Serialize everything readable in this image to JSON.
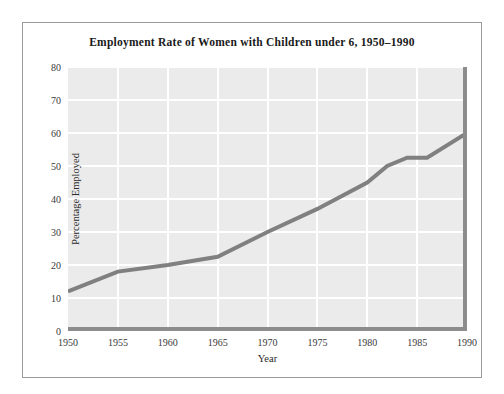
{
  "figure": {
    "background_color": "#ffffff",
    "frame_border_color": "#9a9a9a"
  },
  "chart_data": {
    "type": "line",
    "title": "Employment Rate of Women with Children under 6, 1950–1990",
    "xlabel": "Year",
    "ylabel": "Percentage Employed",
    "xlim": [
      1950,
      1990
    ],
    "ylim": [
      0,
      80
    ],
    "xticks": [
      1950,
      1955,
      1960,
      1965,
      1970,
      1975,
      1980,
      1985,
      1990
    ],
    "xticklabels": [
      "1950",
      "1955",
      "1960",
      "1965",
      "1970",
      "1975",
      "1980",
      "1985",
      "1990"
    ],
    "yticks": [
      0,
      10,
      20,
      30,
      40,
      50,
      60,
      70,
      80
    ],
    "yticklabels": [
      "0",
      "10",
      "20",
      "30",
      "40",
      "50",
      "60",
      "70",
      "80"
    ],
    "grid": true,
    "grid_color": "#ffffff",
    "plot_background_color": "#ebebeb",
    "legend": false,
    "legend_position": "none",
    "axis_line_color": "#8c8c8c",
    "line_color": "#808080",
    "line_width": 4,
    "x": [
      1950,
      1955,
      1960,
      1965,
      1970,
      1975,
      1980,
      1982,
      1984,
      1986,
      1990
    ],
    "y": [
      12,
      18,
      20,
      22.5,
      30,
      37,
      45,
      50,
      52.5,
      52.5,
      60
    ],
    "series": [
      {
        "name": "Percentage Employed",
        "x": [
          1950,
          1955,
          1960,
          1965,
          1970,
          1975,
          1980,
          1982,
          1984,
          1986,
          1990
        ],
        "values": [
          12,
          18,
          20,
          22.5,
          30,
          37,
          45,
          50,
          52.5,
          52.5,
          60
        ]
      }
    ],
    "annotations": []
  }
}
